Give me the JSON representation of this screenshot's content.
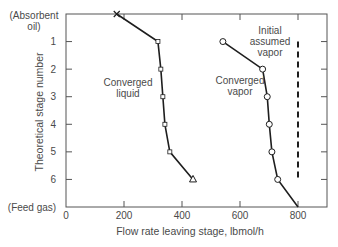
{
  "chart_data": {
    "type": "line",
    "title": "",
    "xlabel": "Flow rate leaving stage, lbmol/h",
    "ylabel": "Theoretical stage number",
    "xlim": [
      0,
      900
    ],
    "ylim": [
      0,
      7
    ],
    "y_inverted": true,
    "grid": false,
    "x_ticks": [
      0,
      200,
      400,
      600,
      800
    ],
    "x_tick_labels": [
      "0",
      "200",
      "400",
      "600",
      "800"
    ],
    "y_ticks": [
      0,
      1,
      2,
      3,
      4,
      5,
      6,
      7
    ],
    "y_tick_labels": [
      "(Absorbent\noil)",
      "1",
      "2",
      "3",
      "4",
      "5",
      "6",
      "(Feed gas)"
    ],
    "series": [
      {
        "name": "Converged liquid",
        "marker": "square-small",
        "start_marker": "x",
        "end_marker": "triangle",
        "stages": [
          0,
          1,
          2,
          3,
          4,
          5,
          6
        ],
        "values": [
          175,
          317,
          327,
          334,
          341,
          358,
          438
        ]
      },
      {
        "name": "Converged vapor",
        "marker": "circle-open",
        "stages": [
          1,
          2,
          3,
          4,
          5,
          6,
          7
        ],
        "values": [
          541,
          678,
          694,
          701,
          710,
          730,
          800
        ]
      },
      {
        "name": "Initial assumed vapor",
        "style": "dashed",
        "stages": [
          1,
          6
        ],
        "values": [
          800,
          800
        ]
      }
    ],
    "annotations": [
      {
        "text": "Converged\nliquid",
        "near_series": "Converged liquid"
      },
      {
        "text": "Converged\nvapor",
        "near_series": "Converged vapor"
      },
      {
        "text": "Initial\nassumed\nvapor",
        "near_series": "Initial assumed vapor"
      }
    ]
  },
  "labels": {
    "xlabel": "Flow rate leaving stage, lbmol/h",
    "ylabel": "Theoretical stage number",
    "top_label_1": "(Absorbent",
    "top_label_2": "oil)",
    "bottom_label": "(Feed gas)",
    "liquid_1": "Converged",
    "liquid_2": "liquid",
    "vapor_1": "Converged",
    "vapor_2": "vapor",
    "initial_1": "Initial",
    "initial_2": "assumed",
    "initial_3": "vapor"
  },
  "colors": {
    "line": "#1e1e1e",
    "axis": "#555555",
    "text": "#4a4a4a"
  }
}
